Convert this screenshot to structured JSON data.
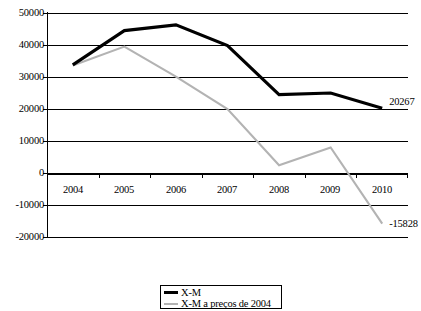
{
  "chart_data": {
    "type": "line",
    "title": "",
    "xlabel": "",
    "ylabel": "",
    "categories": [
      "2004",
      "2005",
      "2006",
      "2007",
      "2008",
      "2009",
      "2010"
    ],
    "ylim": [
      -20000,
      50000
    ],
    "ytick_step": 10000,
    "yticks": [
      "50000",
      "40000",
      "30000",
      "20000",
      "10000",
      "0",
      "-10000",
      "-20000"
    ],
    "grid": true,
    "legend_position": "bottom-center",
    "series": [
      {
        "name": "X-M",
        "color": "#000000",
        "values": [
          33800,
          44500,
          46300,
          39800,
          24500,
          25000,
          20267
        ],
        "end_label": "20267"
      },
      {
        "name": "X-M a preços de 2004",
        "color": "#b3b3b3",
        "values": [
          33600,
          39500,
          30100,
          20000,
          2400,
          8000,
          -15828
        ],
        "end_label": "-15828"
      }
    ],
    "data_labels": [
      {
        "text": "20267",
        "series": "X-M"
      },
      {
        "text": "-15828",
        "series": "X-M a preços de 2004"
      }
    ]
  },
  "legend": {
    "items": [
      {
        "label": "X-M",
        "color": "#000000"
      },
      {
        "label": "X-M a preços de 2004",
        "color": "#b3b3b3"
      }
    ]
  }
}
